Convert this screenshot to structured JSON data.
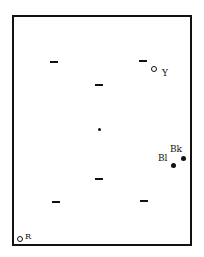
{
  "diagram": {
    "frame": {
      "left": 12,
      "top": 15,
      "right": 191,
      "bottom": 245
    },
    "center_point": {
      "x": 100,
      "y": 130
    },
    "dashes": [
      {
        "x": 50,
        "y": 62
      },
      {
        "x": 139,
        "y": 61
      },
      {
        "x": 95,
        "y": 85
      },
      {
        "x": 95,
        "y": 179
      },
      {
        "x": 52,
        "y": 202
      },
      {
        "x": 140,
        "y": 201
      }
    ],
    "markers": [
      {
        "id": "Y",
        "label": "Y",
        "style": "open-circle"
      },
      {
        "id": "Bl",
        "label": "Bl",
        "style": "filled-circle"
      },
      {
        "id": "Bk",
        "label": "Bk",
        "style": "filled-circle"
      },
      {
        "id": "R",
        "label": "R",
        "style": "open-circle"
      }
    ],
    "colors": {
      "ink": "#111111",
      "background": "#ffffff"
    }
  }
}
